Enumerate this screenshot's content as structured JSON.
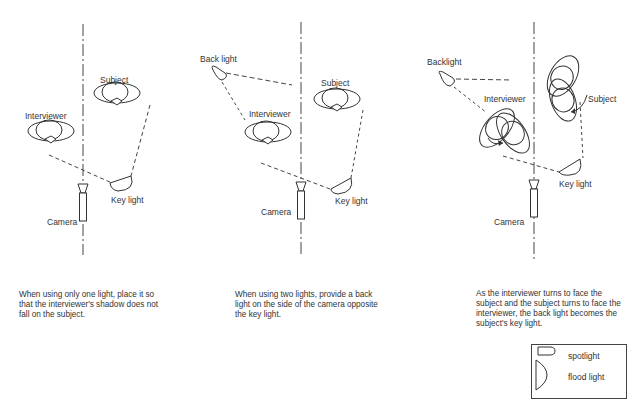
{
  "panels": [
    {
      "labels": {
        "subject": "Subject",
        "interviewer": "Interviewer",
        "key_light": "Key light",
        "camera": "Camera"
      },
      "caption": "When using only one light, place it so that the interviewer's shadow does not fall on the subject."
    },
    {
      "labels": {
        "back_light": "Back light",
        "subject": "Subject",
        "interviewer": "Interviewer",
        "key_light": "Key light",
        "camera": "Camera"
      },
      "caption": "When using two lights, provide a back light on the side of the camera opposite the key light."
    },
    {
      "labels": {
        "back_light": "Backlight",
        "subject": "Subject",
        "interviewer": "Interviewer",
        "key_light": "Key light",
        "camera": "Camera"
      },
      "caption": "As the interviewer turns to face the subject and the subject turns to face the interviewer, the back light becomes the subject's key light."
    }
  ],
  "legend": {
    "items": [
      {
        "icon": "spotlight-icon",
        "label": "spotlight"
      },
      {
        "icon": "flood-light-icon",
        "label": "flood light"
      }
    ]
  },
  "colors": {
    "ink": "#333333",
    "background": "#ffffff"
  }
}
